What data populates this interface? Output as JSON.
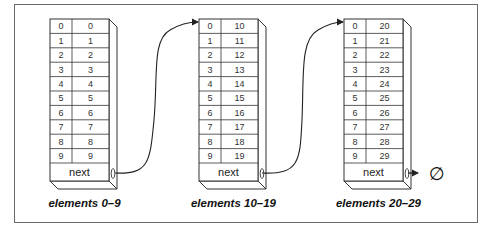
{
  "diagram": {
    "type": "linked-list-of-arrays",
    "nodes": [
      {
        "caption": "elements 0–9",
        "next_label": "next",
        "indices": [
          "0",
          "1",
          "2",
          "3",
          "4",
          "5",
          "6",
          "7",
          "8",
          "9"
        ],
        "values": [
          "0",
          "1",
          "2",
          "3",
          "4",
          "5",
          "6",
          "7",
          "8",
          "9"
        ]
      },
      {
        "caption": "elements 10–19",
        "next_label": "next",
        "indices": [
          "0",
          "1",
          "2",
          "3",
          "4",
          "5",
          "6",
          "7",
          "8",
          "9"
        ],
        "values": [
          "10",
          "11",
          "12",
          "13",
          "14",
          "15",
          "16",
          "17",
          "18",
          "19"
        ]
      },
      {
        "caption": "elements 20–29",
        "next_label": "next",
        "indices": [
          "0",
          "1",
          "2",
          "3",
          "4",
          "5",
          "6",
          "7",
          "8",
          "9"
        ],
        "values": [
          "20",
          "21",
          "22",
          "23",
          "24",
          "25",
          "26",
          "27",
          "28",
          "29"
        ]
      }
    ],
    "terminator_symbol": "∅",
    "colors": {
      "line": "#333333",
      "frame": "#6a6a6a",
      "text": "#333333"
    }
  }
}
